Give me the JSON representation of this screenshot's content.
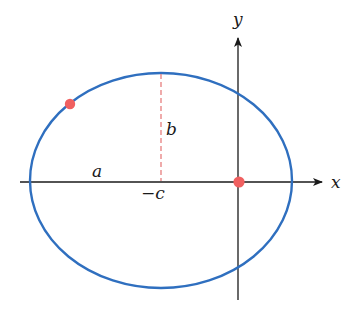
{
  "diagram": {
    "colors": {
      "ellipse": "#2f6fbf",
      "axes": "#1a1a1a",
      "dashed": "#e57373",
      "points": "#f06060"
    },
    "ellipse": {
      "cx": 161,
      "cy": 180.5,
      "rx": 131,
      "ry": 107.5
    },
    "axes": {
      "x": {
        "label": "x",
        "y": 182,
        "x1": 20,
        "x2": 322
      },
      "y": {
        "label": "y",
        "x": 238,
        "y1": 300,
        "y2": 40
      }
    },
    "labels": {
      "a": "a",
      "b": "b",
      "neg_c": "−c"
    },
    "points": [
      {
        "name": "point-on-ellipse",
        "x": 70,
        "y": 104
      },
      {
        "name": "focus-at-origin",
        "x": 239,
        "y": 182
      }
    ]
  }
}
